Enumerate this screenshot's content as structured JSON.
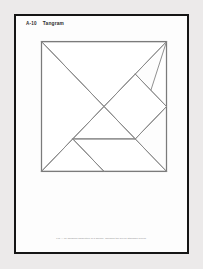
{
  "page": {
    "background_color": "#eceaea",
    "paper_color": "#fdfdfd",
    "frame_color": "#151515"
  },
  "header": {
    "figure_number": "A-10",
    "title": "Tangram"
  },
  "footer": {
    "caption": "Fig. A-10  Tangram dissection of a square, showing the seven standard pieces."
  },
  "diagram": {
    "name": "tangram-square-dissection",
    "stroke_color": "#8a8a8a",
    "outline_color": "#7b7b7b",
    "fill_color": "#ffffff",
    "piece_count": 7,
    "pieces": [
      {
        "id": "large-triangle-top",
        "label": "Large Triangle (top)",
        "points": "0,0 100,0 50,50"
      },
      {
        "id": "large-triangle-left",
        "label": "Large Triangle (left)",
        "points": "0,0 50,50 0,100"
      },
      {
        "id": "medium-triangle",
        "label": "Medium Triangle",
        "points": "100,0 100,50 75,75"
      },
      {
        "id": "small-square",
        "label": "Small Square",
        "points": "50,50 75,25 100,50 75,75"
      },
      {
        "id": "small-triangle-center",
        "label": "Small Triangle (center)",
        "points": "50,50 75,75 25,75"
      },
      {
        "id": "parallelogram",
        "label": "Parallelogram",
        "points": "25,75 75,75 100,100 50,100"
      },
      {
        "id": "small-triangle-bottom",
        "label": "Small Triangle (bottom)",
        "points": "0,100 25,75 50,100"
      }
    ],
    "outline": "0,0 100,0 100,100 0,100",
    "edges": [
      {
        "id": "main-diagonal",
        "x1": 0,
        "y1": 0,
        "x2": 100,
        "y2": 100
      },
      {
        "id": "anti-diagonal",
        "x1": 100,
        "y1": 0,
        "x2": 0,
        "y2": 100
      },
      {
        "id": "square-edge-upper-right",
        "x1": 75,
        "y1": 25,
        "x2": 100,
        "y2": 50
      },
      {
        "id": "square-edge-lower-right",
        "x1": 100,
        "y1": 50,
        "x2": 75,
        "y2": 75
      },
      {
        "id": "horizontal-divider",
        "x1": 25,
        "y1": 75,
        "x2": 75,
        "y2": 75
      },
      {
        "id": "parallelogram-left-edge",
        "x1": 25,
        "y1": 75,
        "x2": 50,
        "y2": 100
      }
    ]
  }
}
